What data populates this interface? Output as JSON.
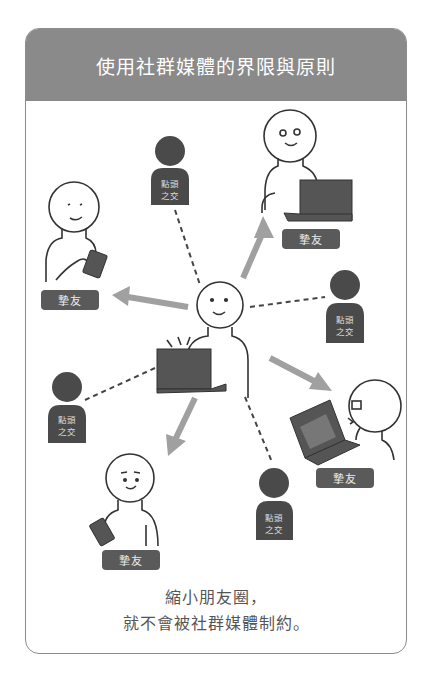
{
  "header": {
    "title": "使用社群媒體的界限與原則"
  },
  "labels": {
    "friend": "摯友",
    "acquaintance_line1": "點頭",
    "acquaintance_line2": "之交"
  },
  "people": {
    "center": {
      "role": "self",
      "device": "laptop"
    },
    "friends": [
      {
        "position": "top-right",
        "device": "laptop",
        "label": "摯友"
      },
      {
        "position": "left",
        "device": "phone",
        "label": "摯友"
      },
      {
        "position": "right",
        "device": "laptop",
        "label": "摯友"
      },
      {
        "position": "bottom-left",
        "device": "phone",
        "label": "摯友"
      }
    ],
    "acquaintances": [
      {
        "position": "top",
        "label": "點頭之交"
      },
      {
        "position": "right",
        "label": "點頭之交"
      },
      {
        "position": "left",
        "label": "點頭之交"
      },
      {
        "position": "bottom",
        "label": "點頭之交"
      }
    ]
  },
  "caption": {
    "line1": "縮小朋友圈，",
    "line2": "就不會被社群媒體制約。"
  },
  "colors": {
    "header_bg": "#8a8a8a",
    "tag_bg": "#5a5a5a",
    "arrow": "#a0a0a0",
    "silhouette": "#4a4a4a",
    "border": "#8c8c8c"
  }
}
